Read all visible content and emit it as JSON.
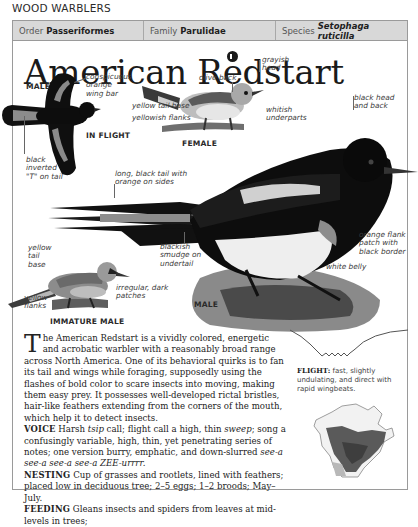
{
  "section": {
    "title": "WOOD WARBLERS"
  },
  "taxonomy": {
    "order_label": "Order",
    "order_value": "Passeriformes",
    "family_label": "Family",
    "family_value": "Parulidae",
    "species_label": "Species",
    "species_value": "Setophaga ruticilla"
  },
  "page": {
    "title": "American Redstart",
    "audio_icon": "audio-play-icon"
  },
  "illustrations": {
    "male_flight": {
      "caption_top": "MALE",
      "caption_bottom": "IN FLIGHT",
      "labels": {
        "wing_bar": "conspicuous\norange\nwing bar",
        "tail": "black\ninverted\n\"T\" on tail"
      }
    },
    "female": {
      "caption": "FEMALE",
      "labels": {
        "head": "grayish\nhead",
        "back": "olive back",
        "tail_base": "yellow tail base",
        "flanks": "yellowish flanks",
        "underparts": "whitish\nunderparts"
      }
    },
    "male": {
      "caption": "MALE",
      "labels": {
        "head": "black head\nand back",
        "tail": "long, black tail with\norange on sides",
        "undertail": "blackish\nsmudge on\nundertail",
        "flank": "orange flank\npatch with\nblack border",
        "belly": "white belly"
      }
    },
    "immature_male": {
      "caption": "IMMATURE MALE",
      "labels": {
        "tail_base": "yellow\ntail\nbase",
        "flanks": "yellow\nflanks",
        "patches": "irregular, dark\npatches"
      }
    }
  },
  "description": {
    "dropcap": "T",
    "intro": "he American Redstart is a vividly colored, energetic and acrobatic warbler with a reasonably broad range across North America. One of its behavioral quirks is to fan its tail and wings while foraging, supposedly using the flashes of bold color to scare insects into moving, making them easy prey. It possesses well-developed rictal bristles, hair-like feathers extending from the corners of the mouth, which help it to detect insects.",
    "voice": {
      "label": "VOICE",
      "t1": " Harsh ",
      "i1": "tsip",
      "t2": " call; flight call a high, thin ",
      "i2": "sweep",
      "t3": "; song a confusingly variable, high, thin, yet penetrating series of notes; one version burry, emphatic, and down-slurred ",
      "i3": "see-a see-a see-a see-a ZEE-urrrr.",
      "t4": ""
    },
    "nesting": {
      "label": "NESTING",
      "text": " Cup of grasses and rootlets, lined with feathers; placed low in deciduous tree; 2–5 eggs; 1–2 broods; May–July."
    },
    "feeding": {
      "label": "FEEDING",
      "text": " Gleans insects and spiders from leaves at mid-levels in trees;"
    }
  },
  "flight": {
    "label": "FLIGHT:",
    "text": " fast, slightly undulating, and direct with rapid wingbeats."
  },
  "map": {
    "name": "range-map-north-america"
  },
  "colors": {
    "taxbar_bg": "#d8d8d8",
    "frame_border": "#9a9a9a",
    "text": "#1e1e1e",
    "bird_black": "#0d0d0d",
    "range_dark": "#555555"
  }
}
